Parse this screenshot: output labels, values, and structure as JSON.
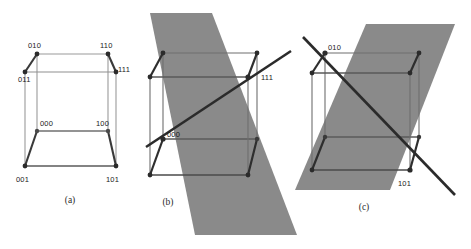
{
  "figure": {
    "background_color": "#ffffff",
    "plane_color": "#8a8a8a",
    "edge_color_light": "#9a9a9a",
    "edge_color_dark": "#3a3a3a",
    "line_color": "#2b2b2b",
    "vertex_color": "#2b2b2b",
    "panels": [
      {
        "id": "a",
        "caption": "(a)",
        "caption_pos": [
          70,
          203
        ],
        "has_plane": false,
        "has_diagonal": false,
        "cube": {
          "front_bottom_left": [
            25,
            166
          ],
          "front_bottom_right": [
            116,
            166
          ],
          "front_top_left": [
            25,
            72
          ],
          "front_top_right": [
            116,
            72
          ],
          "back_bottom_left": [
            37,
            131
          ],
          "back_bottom_right": [
            108,
            131
          ],
          "back_top_left": [
            37,
            54
          ],
          "back_top_right": [
            108,
            54
          ]
        },
        "labels": [
          {
            "text": "010",
            "x": 28,
            "y": 48,
            "anchor": "start"
          },
          {
            "text": "110",
            "x": 100,
            "y": 48,
            "anchor": "start"
          },
          {
            "text": "011",
            "x": 18,
            "y": 82,
            "anchor": "start"
          },
          {
            "text": "111",
            "x": 118,
            "y": 72,
            "anchor": "start"
          },
          {
            "text": "000",
            "x": 40,
            "y": 126,
            "anchor": "start"
          },
          {
            "text": "100",
            "x": 96,
            "y": 126,
            "anchor": "start"
          },
          {
            "text": "001",
            "x": 16,
            "y": 182,
            "anchor": "start"
          },
          {
            "text": "101",
            "x": 106,
            "y": 182,
            "anchor": "start"
          }
        ]
      },
      {
        "id": "b",
        "caption": "(b)",
        "caption_pos": [
          168,
          205
        ],
        "has_plane": true,
        "has_diagonal": true,
        "plane_points": "150,13 212,13 297,235 195,235",
        "cube": {
          "front_bottom_left": [
            150,
            175
          ],
          "front_bottom_right": [
            248,
            175
          ],
          "front_top_left": [
            150,
            77
          ],
          "front_top_right": [
            248,
            77
          ],
          "back_bottom_left": [
            163,
            139
          ],
          "back_bottom_right": [
            257,
            139
          ],
          "back_top_left": [
            163,
            53
          ],
          "back_top_right": [
            257,
            53
          ]
        },
        "diagonal": {
          "x1": 146,
          "y1": 147,
          "x2": 291,
          "y2": 51
        },
        "labels": [
          {
            "text": "000",
            "x": 167,
            "y": 137,
            "anchor": "start"
          },
          {
            "text": "111",
            "x": 261,
            "y": 80,
            "anchor": "start"
          }
        ]
      },
      {
        "id": "c",
        "caption": "(c)",
        "caption_pos": [
          364,
          210
        ],
        "has_plane": true,
        "has_diagonal": true,
        "plane_points": "366,24 455,24 390,190 295,190",
        "cube": {
          "front_bottom_left": [
            312,
            170
          ],
          "front_bottom_right": [
            410,
            170
          ],
          "front_top_left": [
            312,
            73
          ],
          "front_top_right": [
            410,
            73
          ],
          "back_bottom_left": [
            325,
            137
          ],
          "back_bottom_right": [
            419,
            137
          ],
          "back_top_left": [
            325,
            53
          ],
          "back_top_right": [
            419,
            53
          ]
        },
        "diagonal": {
          "x1": 303,
          "y1": 37,
          "x2": 455,
          "y2": 195
        },
        "labels": [
          {
            "text": "010",
            "x": 328,
            "y": 50,
            "anchor": "start"
          },
          {
            "text": "101",
            "x": 398,
            "y": 186,
            "anchor": "start"
          }
        ]
      }
    ]
  }
}
